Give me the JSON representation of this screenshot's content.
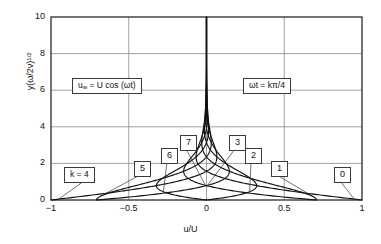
{
  "chart_data": {
    "type": "line",
    "title": "",
    "subtitle": "",
    "xlabel": "u/U",
    "ylabel": "y(ω/2ν)",
    "ylabel_exponent": "1/2",
    "xlim": [
      -1,
      1
    ],
    "ylim": [
      0,
      10
    ],
    "xticks": [
      "−1",
      "−0.5",
      "0",
      "0.5",
      "1"
    ],
    "xtick_values": [
      -1,
      -0.5,
      0,
      0.5,
      1
    ],
    "yticks": [
      "0",
      "2",
      "4",
      "6",
      "8",
      "10"
    ],
    "ytick_values": [
      0,
      2,
      4,
      6,
      8,
      10
    ],
    "grid": true,
    "legend_position": "inline-callouts",
    "equation": "u/U = exp(-eta) * cos(omega*t - eta)",
    "annotations": [
      {
        "name": "wall-velocity-equation",
        "text": "u_w = U cos (ωt)",
        "x_px": 72,
        "y_px": 78
      },
      {
        "name": "phase-definition",
        "text": "ωt = kπ/4",
        "x_px": 243,
        "y_px": 78
      },
      {
        "name": "k-equals-4-label",
        "text": "k = 4",
        "x_px": 64,
        "y_px": 167
      }
    ],
    "series": [
      {
        "name": "0",
        "k": 0,
        "phase_deg": 0,
        "label_x_px": 334,
        "label_y_px": 167,
        "leader_to": [
          -0.7,
          0.05
        ]
      },
      {
        "name": "1",
        "k": 1,
        "phase_deg": 45,
        "label_x_px": 271,
        "label_y_px": 161,
        "leader_to": [
          -0.48,
          0.2
        ]
      },
      {
        "name": "2",
        "k": 2,
        "phase_deg": 90,
        "label_x_px": 245,
        "label_y_px": 148,
        "leader_to": [
          -0.3,
          0.45
        ]
      },
      {
        "name": "3",
        "k": 3,
        "phase_deg": 135,
        "label_x_px": 229,
        "label_y_px": 135,
        "leader_to": [
          -0.18,
          0.8
        ]
      },
      {
        "name": "6",
        "k": 6,
        "phase_deg": 270,
        "label_x_px": 161,
        "label_y_px": 148,
        "leader_to": [
          0.3,
          0.45
        ]
      },
      {
        "name": "7",
        "k": 7,
        "phase_deg": 315,
        "label_x_px": 180,
        "label_y_px": 135,
        "leader_to": [
          0.18,
          0.8
        ]
      },
      {
        "name": "5",
        "k": 5,
        "phase_deg": 225,
        "label_x_px": 134,
        "label_y_px": 161,
        "leader_to": [
          0.48,
          0.2
        ]
      },
      {
        "name": "4",
        "k": 4,
        "phase_deg": 180,
        "label_x_px": 64,
        "label_y_px": 167,
        "leader_to": [
          0.7,
          0.05
        ]
      }
    ],
    "colors": {
      "curve": "#111111",
      "grid": "#8a8a8a",
      "axis": "#1a1a1a",
      "background": "#ffffff"
    }
  }
}
